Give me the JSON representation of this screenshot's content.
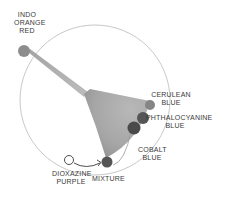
{
  "diagram": {
    "type": "color-mixing-wheel",
    "colors": {
      "circle_stroke": "#c8c8c8",
      "dot_light": "#8c8c8c",
      "dot_mid": "#6a6a6a",
      "dot_dark": "#4a4a4a",
      "wedge": "#a9a9a9",
      "text": "#3a3a3a"
    },
    "labels": {
      "indo_line1": "INDO",
      "indo_line2": "ORANGE",
      "indo_line3": "RED",
      "cerulean_line1": "CERULEAN",
      "cerulean_line2": "BLUE",
      "phthalo_line1": "PHTHALOCYANINE",
      "phthalo_line2": "BLUE",
      "cobalt_line1": "COBALT",
      "cobalt_line2": "BLUE",
      "dioxazine_line1": "DIOXAZINE",
      "dioxazine_line2": "PURPLE",
      "mixture": "MIXTURE"
    }
  }
}
